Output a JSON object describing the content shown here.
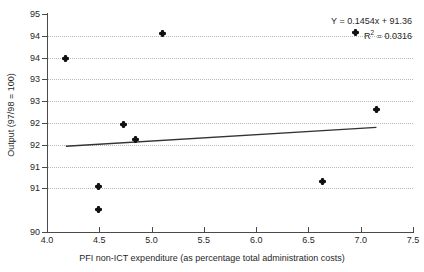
{
  "chart_data": {
    "type": "scatter",
    "title": "",
    "xlabel": "PFI non-ICT expenditure (as percentage total administration costs)",
    "ylabel": "Output (97/98 = 100)",
    "xlim": [
      4.0,
      7.5
    ],
    "ylim": [
      90,
      95
    ],
    "grid": true,
    "legend": false,
    "xticks": [
      "4.0",
      "4.5",
      "5.0",
      "5.5",
      "6.0",
      "6.5",
      "7.0",
      "7.5"
    ],
    "xtick_values": [
      4.0,
      4.5,
      5.0,
      5.5,
      6.0,
      6.5,
      7.0,
      7.5
    ],
    "yticks": [
      "95",
      "94",
      "94",
      "93",
      "93",
      "92",
      "92",
      "91",
      "91",
      "90"
    ],
    "ytick_values": [
      95.0,
      94.5,
      94.0,
      93.5,
      93.0,
      92.5,
      92.0,
      91.5,
      91.0,
      90.0
    ],
    "points": [
      {
        "x": 4.18,
        "y": 93.98
      },
      {
        "x": 4.49,
        "y": 90.52
      },
      {
        "x": 4.49,
        "y": 91.05
      },
      {
        "x": 4.73,
        "y": 92.47
      },
      {
        "x": 4.85,
        "y": 92.13
      },
      {
        "x": 5.1,
        "y": 94.55
      },
      {
        "x": 6.63,
        "y": 91.15
      },
      {
        "x": 6.95,
        "y": 94.57
      },
      {
        "x": 7.15,
        "y": 92.82
      }
    ],
    "trendline": {
      "slope": 0.1454,
      "intercept": 91.36,
      "x_start": 4.18,
      "x_end": 7.15,
      "y_start": 91.968,
      "y_end": 92.4
    },
    "annotations": {
      "equation": "Y = 0.1454x + 91.36",
      "r_squared_prefix": "R",
      "r_squared_exponent": "2",
      "r_squared_value": " = 0.0316"
    },
    "colors": {
      "point": "#111111",
      "trendline": "#333333",
      "axis": "#4a4a4a",
      "grid": "#b9b9b9",
      "background": "#ffffff",
      "text": "#1f1f1f"
    }
  }
}
